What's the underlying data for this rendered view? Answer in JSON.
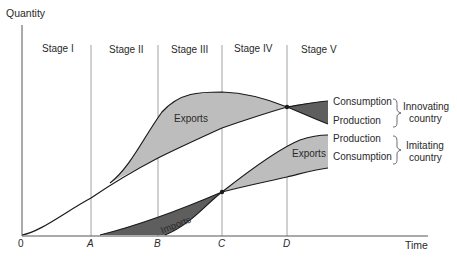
{
  "diagram": {
    "type": "product-life-cycle",
    "y_axis_label": "Quantity",
    "x_axis_label": "Time",
    "origin_label": "0",
    "time_marks": [
      "A",
      "B",
      "C",
      "D"
    ],
    "stages": [
      "Stage I",
      "Stage II",
      "Stage III",
      "Stage IV",
      "Stage V"
    ],
    "region_labels": {
      "innovating_exports": "Exports",
      "imitating_exports": "Exports",
      "imitating_imports": "Imports"
    },
    "curve_labels": {
      "innovating_consumption": "Consumption",
      "innovating_production": "Production",
      "imitating_production": "Production",
      "imitating_consumption": "Consumption"
    },
    "group_labels": {
      "innovating": [
        "Innovating",
        "country"
      ],
      "imitating": [
        "Imitating",
        "country"
      ]
    },
    "colors": {
      "exports_fill": "#bdbdbd",
      "imports_fill": "#5e5e5e",
      "innovating_imports_fill": "#5e5e5e",
      "line": "#1a1a1a",
      "grid": "#8a8a8a"
    }
  }
}
